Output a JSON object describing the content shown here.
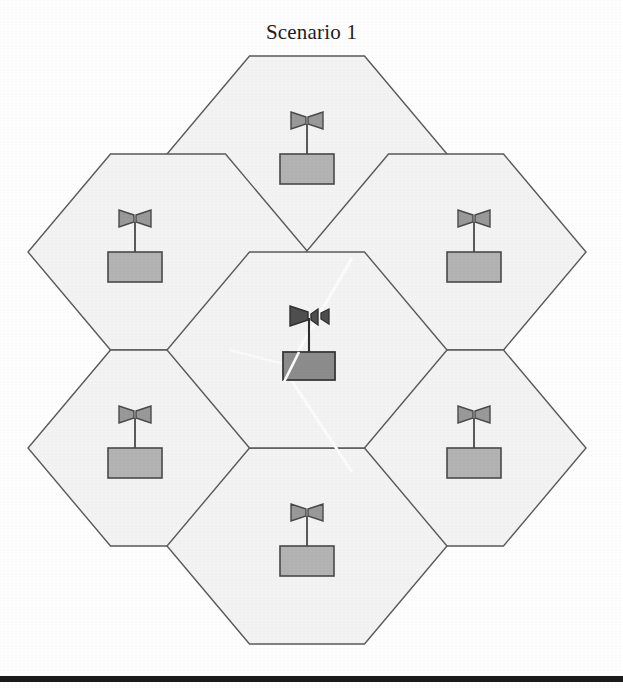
{
  "figure": {
    "title": "Scenario 1",
    "width": 623,
    "height": 688,
    "background_color": "#ffffff",
    "bottom_rule_color": "#1a1a1a"
  },
  "style": {
    "hex_fill": "#f4f4f4",
    "hex_stroke": "#5a5a5a",
    "hex_stroke_width": 1.4,
    "peripheral_box_fill": "#b4b4b4",
    "peripheral_box_stroke": "#4a4a4a",
    "center_box_fill": "#8d8d8d",
    "center_box_stroke": "#3a3a3a",
    "antenna_fill": "#909090",
    "antenna_stroke": "#4a4a4a",
    "center_antenna_fill": "#4f4f4f",
    "center_antenna_stroke": "#303030",
    "crease_color": "#fdfdfd"
  },
  "layout": {
    "orientation": "flat-top",
    "hex_center_x": 307,
    "hex_center_y": 350,
    "hex_half_width": 140,
    "hex_half_height": 98,
    "hex_flat_half": 57,
    "column_step": 212,
    "row_step": 196
  },
  "cells": [
    {
      "id": "cell-center",
      "name": "center-cell",
      "role": "center",
      "cx": 307,
      "cy": 350,
      "station_label": "base-station-center",
      "box_fill": "#8d8d8d",
      "antenna_style": "bold-asymmetric"
    },
    {
      "id": "cell-top",
      "name": "top-cell",
      "role": "neighbor",
      "cx": 307,
      "cy": 154,
      "station_label": "base-station-top",
      "box_fill": "#b4b4b4",
      "antenna_style": "bowtie"
    },
    {
      "id": "cell-upper-left",
      "name": "upper-left-cell",
      "role": "neighbor",
      "cx": 168,
      "cy": 252,
      "station_label": "base-station-upper-left",
      "box_fill": "#b4b4b4",
      "antenna_style": "bowtie"
    },
    {
      "id": "cell-upper-right",
      "name": "upper-right-cell",
      "role": "neighbor",
      "cx": 446,
      "cy": 252,
      "station_label": "base-station-upper-right",
      "box_fill": "#b4b4b4",
      "antenna_style": "bowtie"
    },
    {
      "id": "cell-lower-left",
      "name": "lower-left-cell",
      "role": "neighbor",
      "cx": 168,
      "cy": 448,
      "station_label": "base-station-lower-left",
      "box_fill": "#b4b4b4",
      "antenna_style": "bowtie"
    },
    {
      "id": "cell-lower-right",
      "name": "lower-right-cell",
      "role": "neighbor",
      "cx": 446,
      "cy": 448,
      "station_label": "base-station-lower-right",
      "box_fill": "#b4b4b4",
      "antenna_style": "bowtie"
    },
    {
      "id": "cell-bottom",
      "name": "bottom-cell",
      "role": "neighbor",
      "cx": 307,
      "cy": 546,
      "station_label": "base-station-bottom",
      "box_fill": "#b4b4b4",
      "antenna_style": "bowtie"
    }
  ],
  "creases": [
    {
      "name": "crease-diagonal-upper",
      "x1": 352,
      "y1": 258,
      "x2": 286,
      "y2": 372
    },
    {
      "name": "crease-diagonal-lower",
      "x1": 286,
      "y1": 372,
      "x2": 352,
      "y2": 470
    },
    {
      "name": "crease-horizontal-left",
      "x1": 232,
      "y1": 352,
      "x2": 292,
      "y2": 366
    }
  ]
}
